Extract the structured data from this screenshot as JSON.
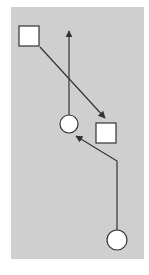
{
  "diagram": {
    "background": "#ffffff",
    "panel": {
      "x": 11,
      "y": 7,
      "width": 133,
      "height": 252,
      "fill": "#cfcfcf"
    },
    "stroke_color": "#333333",
    "node_fill": "#ffffff",
    "nodes": [
      {
        "id": "square-top-left",
        "shape": "square",
        "x": 19,
        "y": 26,
        "size": 20
      },
      {
        "id": "square-right",
        "shape": "square",
        "x": 96,
        "y": 123,
        "size": 20
      },
      {
        "id": "circle-middle",
        "shape": "circle",
        "cx": 69,
        "cy": 124,
        "r": 9
      },
      {
        "id": "circle-bottom",
        "shape": "circle",
        "cx": 117,
        "cy": 240,
        "r": 10
      }
    ],
    "edges": [
      {
        "id": "arrow-circle-middle-up",
        "points": [
          [
            69,
            115
          ],
          [
            69,
            31
          ]
        ],
        "arrowhead": "end"
      },
      {
        "id": "arrow-square-to-square",
        "points": [
          [
            40,
            47
          ],
          [
            105,
            118
          ]
        ],
        "arrowhead": "end"
      },
      {
        "id": "arrow-circle-bottom-to-circle-middle",
        "points": [
          [
            117,
            230
          ],
          [
            117,
            161
          ],
          [
            76,
            136
          ]
        ],
        "arrowhead": "end"
      }
    ]
  }
}
